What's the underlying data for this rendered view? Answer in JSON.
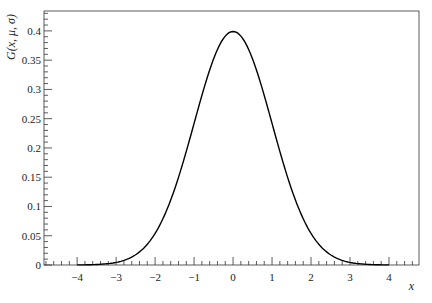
{
  "chart_data": {
    "type": "line",
    "title": "",
    "xlabel": "x",
    "ylabel": "G(x, μ, σ)",
    "xlim": [
      -4.85,
      4.77
    ],
    "ylim": [
      0,
      0.434
    ],
    "x_ticks": [
      -4,
      -3,
      -2,
      -1,
      0,
      1,
      2,
      3,
      4
    ],
    "x_tick_labels": [
      "−4",
      "−3",
      "−2",
      "−1",
      "0",
      "1",
      "2",
      "3",
      "4"
    ],
    "y_ticks": [
      0,
      0.05,
      0.1,
      0.15,
      0.2,
      0.25,
      0.3,
      0.35,
      0.4
    ],
    "y_tick_labels": [
      "0",
      "0.05",
      "0.1",
      "0.15",
      "0.2",
      "0.25",
      "0.3",
      "0.35",
      "0.4"
    ],
    "grid": false,
    "legend": null,
    "series": [
      {
        "name": "Gaussian (μ=0, σ=1)",
        "color": "#000000",
        "function": "exp(-x^2/2)/sqrt(2π)",
        "x": [
          -4,
          -3.5,
          -3,
          -2.5,
          -2,
          -1.5,
          -1,
          -0.5,
          0,
          0.5,
          1,
          1.5,
          2,
          2.5,
          3,
          3.5,
          4
        ],
        "values": [
          0.0001,
          0.0009,
          0.0044,
          0.0175,
          0.054,
          0.1295,
          0.242,
          0.3521,
          0.3989,
          0.3521,
          0.242,
          0.1295,
          0.054,
          0.0175,
          0.0044,
          0.0009,
          0.0001
        ]
      }
    ]
  },
  "plot": {
    "x_axis_title": "x",
    "y_axis_title": "G(x, μ, σ)"
  }
}
